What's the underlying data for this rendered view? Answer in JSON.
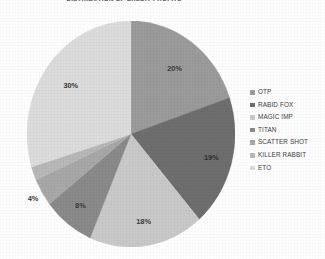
{
  "chart_data": {
    "type": "pie",
    "title": "DISTRIBUTION OF CREDIT PROFITS",
    "xlabel": "",
    "ylabel": "",
    "legend_position": "right",
    "grid": false,
    "start_angle_deg": 0,
    "direction": "clockwise",
    "categories": [
      "OTP",
      "RABID FOX",
      "MAGIC IMP",
      "TITAN",
      "SCATTER SHOT",
      "KILLER RABBIT",
      "ETO"
    ],
    "values": [
      20,
      19,
      18,
      8,
      4,
      2,
      30
    ],
    "value_labels": [
      "20%",
      "19%",
      "18%",
      "8%",
      "4%",
      "2%",
      "30%"
    ],
    "colors": [
      "#9b9b9b",
      "#6e6e6e",
      "#c9c9c9",
      "#8a8a8a",
      "#a8a8a8",
      "#b8b8b8",
      "#dcdcdc"
    ],
    "slices": [
      {
        "name": "OTP",
        "value": 20,
        "label": "20%",
        "color": "#9b9b9b",
        "label_tone": "dark"
      },
      {
        "name": "RABID FOX",
        "value": 19,
        "label": "19%",
        "color": "#6e6e6e",
        "label_tone": "light"
      },
      {
        "name": "MAGIC IMP",
        "value": 18,
        "label": "18%",
        "color": "#c9c9c9",
        "label_tone": "dark"
      },
      {
        "name": "TITAN",
        "value": 8,
        "label": "8%",
        "color": "#8a8a8a",
        "label_tone": "dark"
      },
      {
        "name": "SCATTER SHOT",
        "value": 4,
        "label": "4%",
        "color": "#a8a8a8",
        "label_tone": "dark"
      },
      {
        "name": "KILLER RABBIT",
        "value": 2,
        "label": "2%",
        "color": "#b8b8b8",
        "label_tone": "dark"
      },
      {
        "name": "ETO",
        "value": 30,
        "label": "30%",
        "color": "#dcdcdc",
        "label_tone": "dark"
      }
    ]
  },
  "legend": {
    "items": [
      {
        "label": "OTP",
        "color": "#9b9b9b"
      },
      {
        "label": "RABID FOX",
        "color": "#6e6e6e"
      },
      {
        "label": "MAGIC IMP",
        "color": "#c9c9c9"
      },
      {
        "label": "TITAN",
        "color": "#8a8a8a"
      },
      {
        "label": "SCATTER SHOT",
        "color": "#a8a8a8"
      },
      {
        "label": "KILLER RABBIT",
        "color": "#b8b8b8"
      },
      {
        "label": "ETO",
        "color": "#dcdcdc"
      }
    ]
  }
}
